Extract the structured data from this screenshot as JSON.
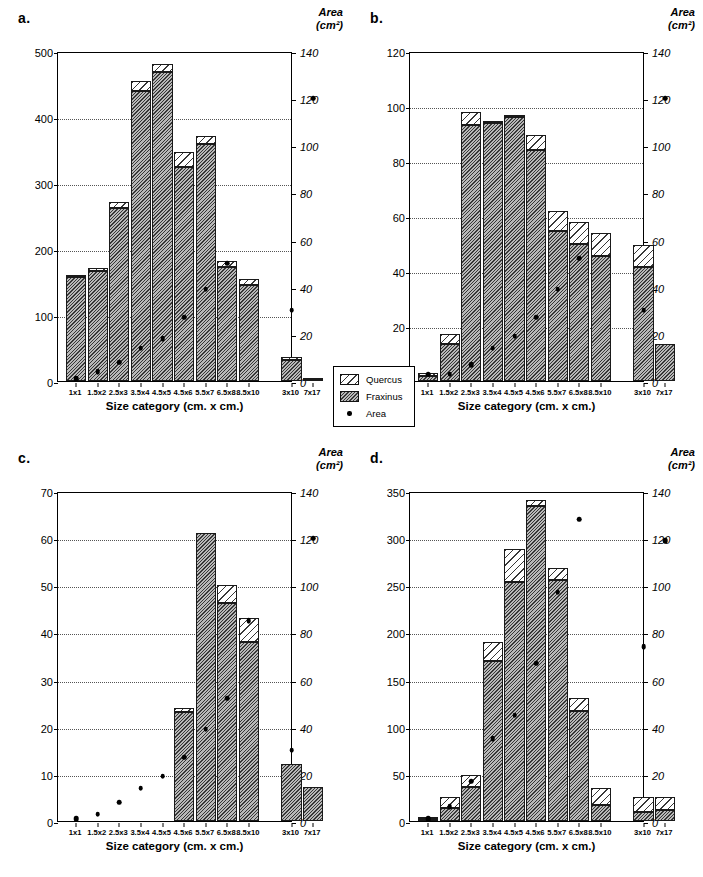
{
  "figure": {
    "categories": [
      "1x1",
      "1.5x2",
      "2.5x3",
      "3.5x4",
      "4.5x5",
      "4.5x6",
      "5.5x7",
      "6.5x8",
      "8.5x10",
      "3x10",
      "7x17"
    ],
    "xlabel": "Size category (cm. x cm.)",
    "right_axis_title_line1": "Area",
    "right_axis_title_line2": "(cm²)",
    "right_ticks": [
      0,
      20,
      40,
      60,
      80,
      100,
      120,
      140
    ]
  },
  "legend": {
    "items": [
      {
        "label": "Quercus",
        "swatch": "quercus-hatch"
      },
      {
        "label": "Fraxinus",
        "swatch": "fraxinus-hatch"
      },
      {
        "label": "Area",
        "swatch": "area-dot"
      }
    ]
  },
  "panels": [
    {
      "key": "a",
      "label": "a.",
      "ylim": [
        0,
        500
      ],
      "yticks": [
        0,
        100,
        200,
        300,
        400,
        500
      ],
      "gridvalues": [
        100,
        200,
        300,
        400
      ],
      "fraxinus": [
        157,
        167,
        262,
        440,
        468,
        324,
        359,
        172,
        146,
        32,
        1
      ],
      "quercus": [
        1,
        4,
        9,
        15,
        13,
        23,
        12,
        10,
        9,
        4,
        4
      ],
      "area": [
        1,
        4,
        8,
        14,
        18,
        27,
        39,
        50,
        0,
        30,
        120
      ]
    },
    {
      "key": "b",
      "label": "b.",
      "ylim": [
        0,
        120
      ],
      "yticks": [
        0,
        20,
        40,
        60,
        80,
        100,
        120
      ],
      "gridvalues": [
        20,
        40,
        60,
        80,
        100
      ],
      "fraxinus": [
        2,
        13.5,
        93,
        94,
        96,
        84,
        54.5,
        50,
        45.5,
        41.5,
        13.5
      ],
      "quercus": [
        1,
        3.5,
        5,
        0.5,
        0.5,
        5.5,
        7.5,
        8,
        8.5,
        8,
        0
      ],
      "area": [
        3,
        3,
        7,
        14,
        19,
        27,
        39,
        52,
        0,
        30,
        120
      ]
    },
    {
      "key": "c",
      "label": "c.",
      "ylim": [
        0,
        70
      ],
      "yticks": [
        0,
        10,
        20,
        30,
        40,
        50,
        60,
        70
      ],
      "gridvalues": [
        10,
        20,
        30,
        40,
        50,
        60
      ],
      "fraxinus": [
        0,
        0,
        0,
        0,
        0,
        23.2,
        61,
        46.2,
        38,
        12.2,
        7.2
      ],
      "quercus": [
        0,
        0,
        0,
        0,
        0,
        0.8,
        0,
        3.8,
        5,
        0,
        0
      ],
      "area": [
        1,
        3,
        8,
        14,
        19,
        27,
        39,
        52,
        85,
        30,
        120
      ]
    },
    {
      "key": "d",
      "label": "d.",
      "ylim": [
        0,
        350
      ],
      "yticks": [
        0,
        50,
        100,
        150,
        200,
        250,
        300,
        350
      ],
      "gridvalues": [
        50,
        100,
        150,
        200,
        250,
        300
      ],
      "fraxinus": [
        2,
        14,
        36,
        170,
        253,
        334,
        256,
        117,
        17,
        10,
        12
      ],
      "quercus": [
        2,
        11,
        13,
        20,
        35,
        6,
        12,
        14,
        18,
        15,
        14
      ],
      "area": [
        1,
        6,
        17,
        35,
        45,
        67,
        97,
        128,
        0,
        74,
        119
      ]
    }
  ]
}
